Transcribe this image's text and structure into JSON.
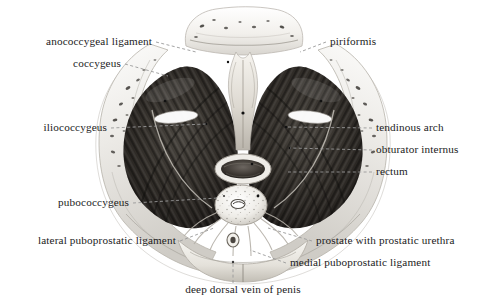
{
  "figure": {
    "background_color": "#ffffff",
    "text_color": "#1b1b1b",
    "leader_color": "#9a9a9a"
  },
  "labels": [
    {
      "id": "anococcygeal-ligament",
      "text": "anococcygeal ligament",
      "align": "left",
      "x": 152,
      "y": 42,
      "leader": [
        [
          156,
          42
        ],
        [
          196,
          52
        ]
      ]
    },
    {
      "id": "coccygeus",
      "text": "coccygeus",
      "align": "left",
      "x": 121,
      "y": 64,
      "leader": [
        [
          125,
          64
        ],
        [
          168,
          76
        ]
      ]
    },
    {
      "id": "iliococcygeus",
      "text": "iliococcygeus",
      "align": "left",
      "x": 107,
      "y": 128,
      "leader": [
        [
          111,
          128
        ],
        [
          206,
          124
        ]
      ]
    },
    {
      "id": "pubococcygeus",
      "text": "pubococcygeus",
      "align": "left",
      "x": 129,
      "y": 203,
      "leader": [
        [
          133,
          203
        ],
        [
          218,
          198
        ]
      ]
    },
    {
      "id": "lateral-puboprostatic-ligament",
      "text": "lateral puboprostatic ligament",
      "align": "left",
      "x": 176,
      "y": 241,
      "leader": [
        [
          180,
          241
        ],
        [
          214,
          228
        ]
      ]
    },
    {
      "id": "piriformis",
      "text": "piriformis",
      "align": "right",
      "x": 330,
      "y": 42,
      "leader": [
        [
          326,
          42
        ],
        [
          300,
          52
        ]
      ]
    },
    {
      "id": "tendinous-arch",
      "text": "tendinous arch",
      "align": "right",
      "x": 376,
      "y": 128,
      "leader": [
        [
          372,
          128
        ],
        [
          286,
          127
        ]
      ]
    },
    {
      "id": "obturator-internus",
      "text": "obturator internus",
      "align": "right",
      "x": 376,
      "y": 150,
      "leader": [
        [
          372,
          150
        ],
        [
          290,
          148
        ]
      ]
    },
    {
      "id": "rectum",
      "text": "rectum",
      "align": "right",
      "x": 376,
      "y": 172,
      "leader": [
        [
          372,
          172
        ],
        [
          286,
          172
        ]
      ]
    },
    {
      "id": "prostate-with-prostatic-urethra",
      "text": "prostate with prostatic urethra",
      "align": "right",
      "x": 316,
      "y": 241,
      "leader": [
        [
          312,
          241
        ],
        [
          268,
          228
        ]
      ]
    },
    {
      "id": "medial-puboprostatic-ligament",
      "text": "medial puboprostatic ligament",
      "align": "right",
      "x": 290,
      "y": 263,
      "leader": [
        [
          286,
          263
        ],
        [
          250,
          250
        ]
      ]
    },
    {
      "id": "deep-dorsal-vein-of-penis",
      "text": "deep dorsal vein of penis",
      "align": "center",
      "x": 243,
      "y": 290,
      "leader": [
        [
          233,
          283
        ],
        [
          233,
          262
        ]
      ]
    }
  ]
}
